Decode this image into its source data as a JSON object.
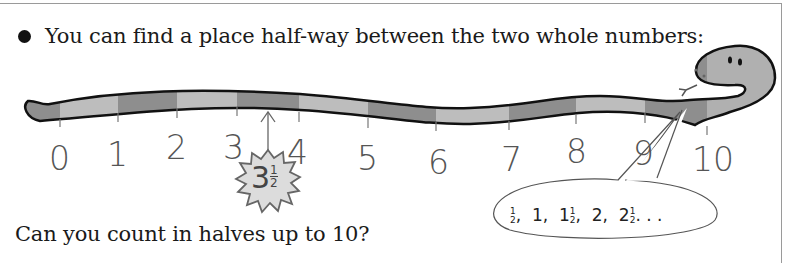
{
  "page": {
    "intro_bullet": "You can find a place half-way between the two whole numbers:",
    "question": "Can you count in halves up to 10?"
  },
  "number_line": {
    "labels": [
      "0",
      "1",
      "2",
      "3",
      "4",
      "5",
      "6",
      "7",
      "8",
      "9",
      "10"
    ],
    "highlight": {
      "whole": "3",
      "numerator": "1",
      "denominator": "2",
      "value": "3½"
    }
  },
  "speech_bubble": {
    "sequence": [
      {
        "whole": "",
        "frac": true
      },
      {
        "whole": "1",
        "frac": false
      },
      {
        "whole": "1",
        "frac": true
      },
      {
        "whole": "2",
        "frac": false
      },
      {
        "whole": "2",
        "frac": true
      }
    ],
    "separator": ",",
    "ellipsis": ". . .",
    "text": "½, 1, 1½, 2, 2½. . ."
  },
  "colors": {
    "snake_dark": "#8a8a8a",
    "snake_light": "#b8b8b8",
    "snake_outline": "#111111",
    "text": "#1a1a1a",
    "numbers": "#555555",
    "burst_fill": "#dcdcdc",
    "frame_border": "#9a9a9a"
  }
}
